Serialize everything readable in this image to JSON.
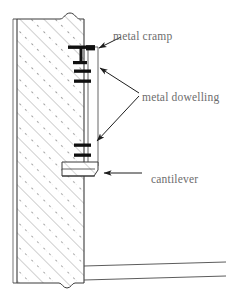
{
  "drawing": {
    "title": "Architectural wall section detail",
    "type": "technical-section-drawing",
    "background_color": "#ffffff",
    "line_color": "#3a3a3a",
    "hatch_color": "#8a8a8a",
    "label_color": "#6d6d6d",
    "metal_color": "#111111"
  },
  "labels": {
    "cramp": "metal cramp",
    "dowelling": "metal dowelling",
    "cantilever": "cantilever"
  },
  "components": {
    "wall": {
      "name": "hatched masonry wall",
      "hatch_pattern": "diagonal-45-with-dashes",
      "break_line_top": true,
      "break_line_bottom": true
    },
    "cladding_panel": {
      "name": "vertical cladding panel",
      "fixings": "metal cramp and metal dowelling"
    },
    "cantilever_slab": {
      "name": "projecting cantilever slab"
    },
    "floor_slab": {
      "name": "floor slab edge lines",
      "line_count": 2
    }
  },
  "annotations": [
    {
      "label_key": "cramp",
      "leader": "arrow pointing down-left to cramp bracket"
    },
    {
      "label_key": "dowelling",
      "leader": "two arrows pointing to upper and lower dowels"
    },
    {
      "label_key": "cantilever",
      "leader": "arrow pointing left to cantilever slab"
    }
  ]
}
